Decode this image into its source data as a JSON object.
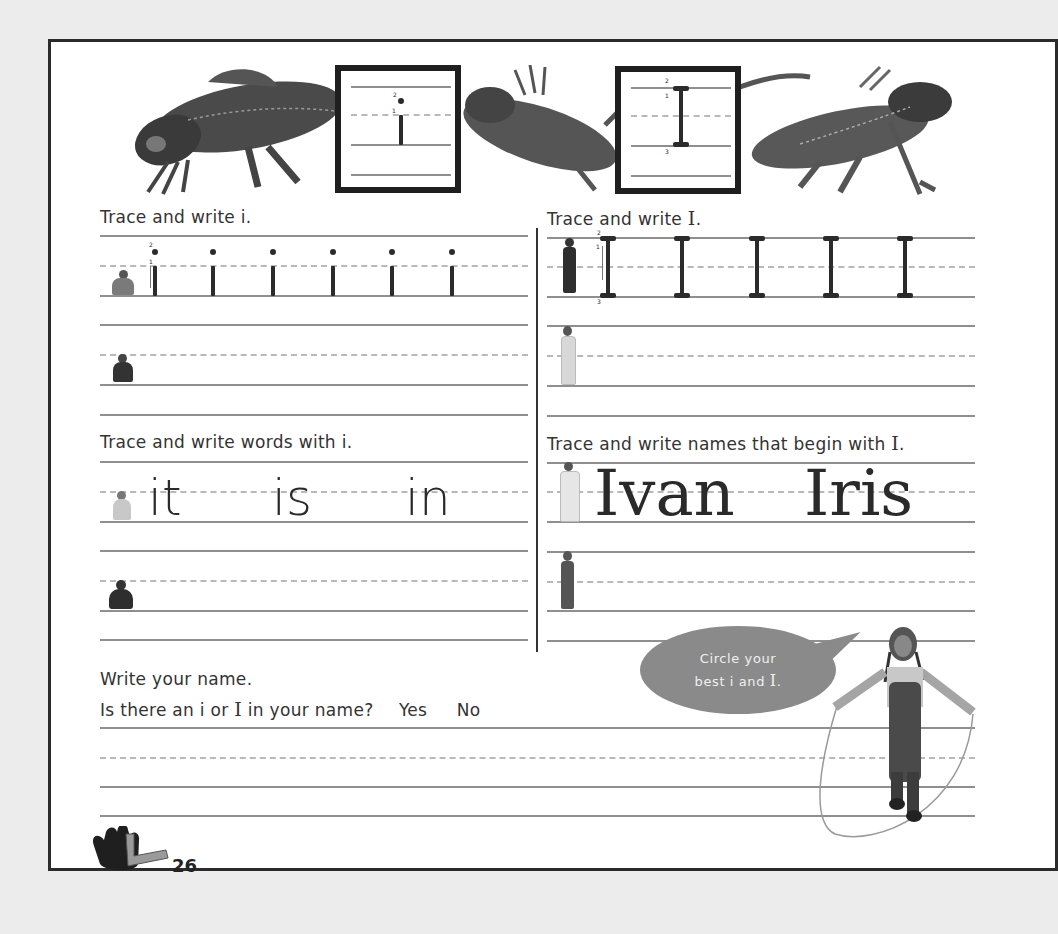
{
  "header_banner": {
    "left_box_letter": "i",
    "left_box_stroke_numbers": [
      "2",
      "1"
    ],
    "right_box_letter": "I",
    "right_box_stroke_numbers": [
      "2",
      "1",
      "3"
    ],
    "images": [
      "lizard-left",
      "lizard-middle",
      "lizard-right"
    ]
  },
  "sections": {
    "trace_i": {
      "instruction": "Trace and write i.",
      "model_letters": [
        "i",
        "i",
        "i",
        "i",
        "i",
        "i"
      ],
      "stroke_numbers": [
        "2",
        "1"
      ]
    },
    "trace_I": {
      "instruction_prefix": "Trace and write ",
      "instruction_letter": "I",
      "instruction_suffix": ".",
      "model_letters": [
        "I",
        "I",
        "I",
        "I",
        "I"
      ],
      "stroke_numbers": [
        "2",
        "1",
        "3"
      ]
    },
    "words_i": {
      "instruction": "Trace and write words with i.",
      "words": [
        "it",
        "is",
        "in"
      ]
    },
    "names_I": {
      "instruction_prefix": "Trace and write names that begin with ",
      "instruction_letter": "I",
      "instruction_suffix": ".",
      "names": [
        "Ivan",
        "Iris"
      ]
    },
    "your_name": {
      "instruction": "Write your name.",
      "question_prefix": "Is there an i or ",
      "question_letter": "I",
      "question_suffix": " in your name?",
      "options": [
        "Yes",
        "No"
      ]
    }
  },
  "speech_bubble": {
    "line1": "Circle your",
    "line2_prefix": "best i and ",
    "line2_letter": "I",
    "line2_suffix": "."
  },
  "footer": {
    "page_number": "26",
    "logo": "hand-L-logo"
  },
  "colors": {
    "page_bg": "#ffffff",
    "outer_bg": "#ececec",
    "line_solid": "#8f8f8f",
    "line_dashed": "#b9b9b9",
    "bubble": "#8a8a8a",
    "ink": "#2b2b2b"
  }
}
